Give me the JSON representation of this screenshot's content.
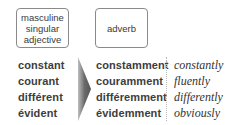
{
  "headers": {
    "adjective_lines": [
      "masculine",
      "singular",
      "adjective"
    ],
    "adverb": "adverb"
  },
  "rows": [
    {
      "adjective": "constant",
      "adverb": "constamment",
      "english": "constantly"
    },
    {
      "adjective": "courant",
      "adverb": "couramment",
      "english": "fluently"
    },
    {
      "adjective": "différent",
      "adverb": "différemment",
      "english": "differently"
    },
    {
      "adjective": "évident",
      "adverb": "évidemment",
      "english": "obviously"
    }
  ],
  "colors": {
    "text": "#3d3d3d",
    "box_border": "#8a8a8a",
    "arrow_dark": "#555555",
    "arrow_light": "#bdbdbd",
    "separator": "#b8b8b8"
  }
}
